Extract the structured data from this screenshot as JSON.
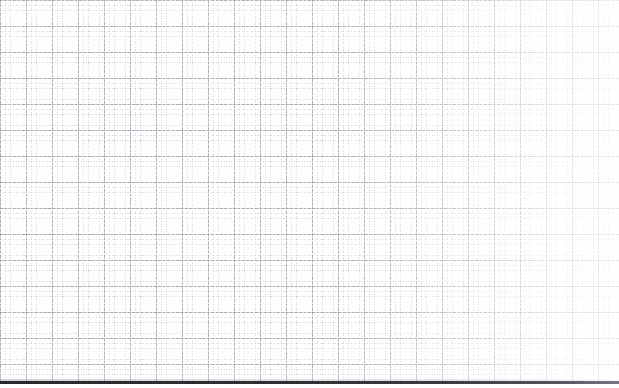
{
  "document": {
    "type": "graph-paper-scan",
    "title": "Blank graph paper sheet",
    "content_text": "",
    "written_content": "none",
    "background_color": "#fefefe"
  },
  "grid": {
    "major_line_color": "#8484 94",
    "major_line_color_hex": "#848494",
    "minor_line_color_hex": "#a8a8b4",
    "major_spacing_px": 26,
    "minor_spacing_px": 5.2,
    "minor_per_major": 5,
    "major_columns": 23,
    "major_rows": 15,
    "line_style": "dashed-dotted"
  },
  "edge": {
    "bottom_bar_color_hex": "#2a2a2e",
    "bottom_bar_position_y": 381,
    "bottom_bar_height_px": 3,
    "description": "dark paper edge"
  },
  "scan": {
    "falloff_direction": "right",
    "falloff_description": "illumination fades toward right edge"
  },
  "canvas": {
    "width": 619,
    "height": 388
  }
}
